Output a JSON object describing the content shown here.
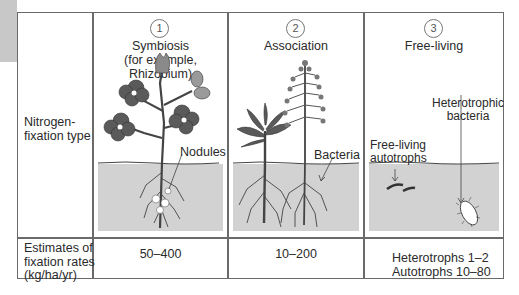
{
  "row_headers": {
    "type": [
      "Nitrogen-",
      "fixation type"
    ],
    "rates": [
      "Estimates of",
      "fixation rates",
      "(kg/ha/yr)"
    ]
  },
  "columns": [
    {
      "number": "1",
      "title": "Symbiosis",
      "subtitle": "(for example, Rhizobium)",
      "callout": "Nodules",
      "rate": "50–400"
    },
    {
      "number": "2",
      "title": "Association",
      "callout": "Bacteria",
      "rate": "10–200"
    },
    {
      "number": "3",
      "title": "Free-living",
      "callout_autotrophs": [
        "Free-living",
        "autotrophs"
      ],
      "callout_heterotrophic": [
        "Heterotrophic",
        "bacteria"
      ],
      "rate_lines": [
        "Heterotrophs 1–2",
        "Autotrophs 10–80"
      ]
    }
  ],
  "colors": {
    "border": "#6a6a6a",
    "soil": "#d2d2d2",
    "leaf": "#5a5a5a",
    "tab": "#c8c8c8"
  }
}
